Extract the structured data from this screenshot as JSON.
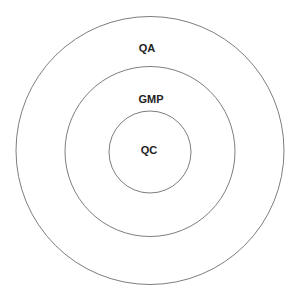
{
  "diagram": {
    "type": "concentric-circles",
    "rings": [
      {
        "label": "QA",
        "cx": 150,
        "cy": 150.5,
        "r": 134,
        "label_x": 147,
        "label_y": 52
      },
      {
        "label": "GMP",
        "cx": 150,
        "cy": 151.5,
        "r": 85,
        "label_x": 151,
        "label_y": 103
      },
      {
        "label": "QC",
        "cx": 150,
        "cy": 152,
        "r": 41,
        "label_x": 149,
        "label_y": 154
      }
    ],
    "stroke_color": "#6e6e6e",
    "text_color": "#222222",
    "background": "#ffffff"
  }
}
